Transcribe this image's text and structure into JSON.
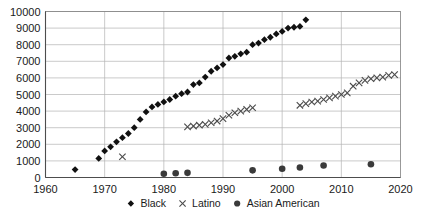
{
  "chart_data": {
    "type": "scatter",
    "title": "",
    "subtitle": "",
    "xlabel": "",
    "ylabel": "",
    "xlim": [
      1960,
      2020
    ],
    "ylim": [
      0,
      10000
    ],
    "xticks": [
      1960,
      1970,
      1980,
      1990,
      2000,
      2010,
      2020
    ],
    "yticks": [
      0,
      1000,
      2000,
      3000,
      4000,
      5000,
      6000,
      7000,
      8000,
      9000,
      10000
    ],
    "grid": true,
    "legend_position": "bottom-center",
    "series": [
      {
        "name": "Black",
        "marker": "diamond",
        "color": "#111111",
        "points": [
          [
            1965,
            480
          ],
          [
            1969,
            1150
          ],
          [
            1970,
            1600
          ],
          [
            1971,
            1850
          ],
          [
            1972,
            2150
          ],
          [
            1973,
            2400
          ],
          [
            1974,
            2650
          ],
          [
            1975,
            3000
          ],
          [
            1976,
            3500
          ],
          [
            1977,
            3950
          ],
          [
            1978,
            4250
          ],
          [
            1979,
            4400
          ],
          [
            1980,
            4550
          ],
          [
            1981,
            4700
          ],
          [
            1982,
            4900
          ],
          [
            1983,
            5050
          ],
          [
            1984,
            5150
          ],
          [
            1985,
            5600
          ],
          [
            1986,
            5700
          ],
          [
            1987,
            6050
          ],
          [
            1988,
            6400
          ],
          [
            1989,
            6600
          ],
          [
            1990,
            6800
          ],
          [
            1991,
            7200
          ],
          [
            1992,
            7300
          ],
          [
            1993,
            7450
          ],
          [
            1994,
            7550
          ],
          [
            1995,
            8000
          ],
          [
            1996,
            8100
          ],
          [
            1997,
            8300
          ],
          [
            1998,
            8450
          ],
          [
            1999,
            8650
          ],
          [
            2000,
            8800
          ],
          [
            2001,
            9000
          ],
          [
            2002,
            9050
          ],
          [
            2003,
            9100
          ],
          [
            2004,
            9500
          ]
        ]
      },
      {
        "name": "Latino",
        "marker": "x",
        "color": "#4a4a4a",
        "points": [
          [
            1973,
            1250
          ],
          [
            1984,
            3050
          ],
          [
            1985,
            3100
          ],
          [
            1986,
            3150
          ],
          [
            1987,
            3200
          ],
          [
            1988,
            3300
          ],
          [
            1989,
            3400
          ],
          [
            1990,
            3550
          ],
          [
            1991,
            3750
          ],
          [
            1992,
            3900
          ],
          [
            1993,
            4000
          ],
          [
            1994,
            4100
          ],
          [
            1995,
            4200
          ],
          [
            2003,
            4350
          ],
          [
            2004,
            4450
          ],
          [
            2005,
            4550
          ],
          [
            2006,
            4600
          ],
          [
            2007,
            4700
          ],
          [
            2008,
            4800
          ],
          [
            2009,
            4900
          ],
          [
            2010,
            5000
          ],
          [
            2011,
            5100
          ],
          [
            2012,
            5500
          ],
          [
            2013,
            5700
          ],
          [
            2014,
            5850
          ],
          [
            2015,
            5950
          ],
          [
            2016,
            6000
          ],
          [
            2017,
            6050
          ],
          [
            2018,
            6150
          ],
          [
            2019,
            6200
          ]
        ]
      },
      {
        "name": "Asian American",
        "marker": "circle",
        "color": "#3a3a3a",
        "points": [
          [
            1980,
            230
          ],
          [
            1982,
            260
          ],
          [
            1984,
            280
          ],
          [
            1995,
            430
          ],
          [
            2000,
            530
          ],
          [
            2003,
            600
          ],
          [
            2007,
            720
          ],
          [
            2015,
            800
          ]
        ]
      }
    ]
  },
  "legend": {
    "items": [
      {
        "label": "Black",
        "marker": "diamond"
      },
      {
        "label": "Latino",
        "marker": "x"
      },
      {
        "label": "Asian American",
        "marker": "circle"
      }
    ]
  }
}
